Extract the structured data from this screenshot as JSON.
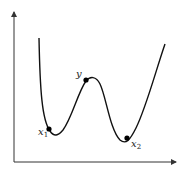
{
  "diagram": {
    "type": "function-curve-with-local-extrema",
    "axes": {
      "x_axis": true,
      "y_axis": true
    },
    "points": [
      {
        "id": "x1",
        "label": "x",
        "subscript": "1",
        "role": "near local minimum (left)"
      },
      {
        "id": "y",
        "label": "y",
        "subscript": "",
        "role": "near local maximum"
      },
      {
        "id": "x2",
        "label": "x",
        "subscript": "2",
        "role": "near local minimum (right)"
      }
    ],
    "colors": {
      "curve": "#111111",
      "axis": "#333333",
      "point": "#000000"
    }
  }
}
